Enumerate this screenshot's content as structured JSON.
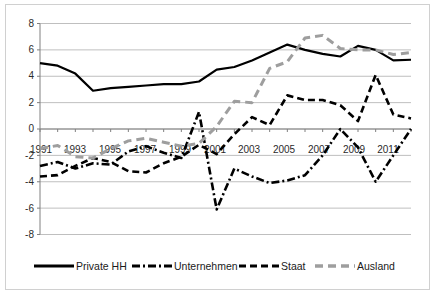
{
  "chart_data": {
    "type": "line",
    "title": "",
    "subtitle": "",
    "xlabel": "",
    "ylabel": "",
    "xlim": [
      1991,
      2012
    ],
    "ylim": [
      -8,
      8
    ],
    "grid": true,
    "legend_position": "bottom",
    "y_ticks": [
      "8",
      "6",
      "4",
      "2",
      "0",
      "-2",
      "-4",
      "-6",
      "-8"
    ],
    "y_tick_values": [
      8,
      6,
      4,
      2,
      0,
      -2,
      -4,
      -6,
      -8
    ],
    "x_ticks": [
      "1991",
      "1993",
      "1995",
      "1997",
      "1999",
      "2001",
      "2003",
      "2005",
      "2007",
      "2009",
      "2011"
    ],
    "x_tick_values": [
      1991,
      1993,
      1995,
      1997,
      1999,
      2001,
      2003,
      2005,
      2007,
      2009,
      2011
    ],
    "x": [
      1991,
      1992,
      1993,
      1994,
      1995,
      1996,
      1997,
      1998,
      1999,
      2000,
      2001,
      2002,
      2003,
      2004,
      2005,
      2006,
      2007,
      2008,
      2009,
      2010,
      2011,
      2012
    ],
    "series": [
      {
        "name": "Private HH",
        "color": "#000000",
        "style": "solid",
        "values": [
          5.0,
          4.8,
          4.2,
          2.9,
          3.1,
          3.2,
          3.3,
          3.4,
          3.4,
          3.6,
          4.5,
          4.7,
          5.2,
          5.8,
          6.4,
          6.0,
          5.7,
          5.5,
          6.3,
          6.0,
          5.2,
          5.25
        ]
      },
      {
        "name": "Unternehmen",
        "color": "#000000",
        "style": "dash-dot",
        "values": [
          -2.8,
          -2.5,
          -3.0,
          -2.6,
          -2.7,
          -1.7,
          -1.3,
          -1.8,
          -2.2,
          1.3,
          -6.1,
          -3.0,
          -3.6,
          -4.1,
          -3.9,
          -3.5,
          -2.0,
          0.0,
          -1.4,
          -4.0,
          -2.0,
          0.0
        ]
      },
      {
        "name": "Staat",
        "color": "#000000",
        "style": "dashed",
        "values": [
          -3.6,
          -3.5,
          -2.8,
          -2.2,
          -2.5,
          -3.2,
          -3.3,
          -2.6,
          -2.1,
          -1.2,
          -1.9,
          -0.4,
          0.9,
          0.3,
          2.55,
          2.2,
          2.2,
          1.8,
          0.6,
          4.1,
          1.1,
          0.8
        ]
      },
      {
        "name": "Ausland",
        "color": "#9e9e9e",
        "style": "dashed-gray",
        "values": [
          -1.5,
          -1.25,
          -2.1,
          -2.2,
          -1.5,
          -0.9,
          -0.7,
          -1.0,
          -1.3,
          -1.1,
          0.2,
          2.1,
          2.0,
          4.6,
          5.1,
          6.9,
          7.1,
          6.1,
          6.0,
          6.0,
          5.65,
          5.8
        ]
      }
    ],
    "legend": [
      {
        "label": "Private HH",
        "color": "#000000",
        "style": "solid"
      },
      {
        "label": "Unternehmen",
        "color": "#000000",
        "style": "dash-dot"
      },
      {
        "label": "Staat",
        "color": "#000000",
        "style": "dashed"
      },
      {
        "label": "Ausland",
        "color": "#9e9e9e",
        "style": "dashed-gray"
      }
    ]
  },
  "colors": {
    "series_black": "#000000",
    "series_gray": "#9e9e9e",
    "gridline": "#bfbfbf",
    "axis": "#808080",
    "frame": "#d0d0d0",
    "text": "#2b2b2b",
    "background": "#ffffff"
  }
}
